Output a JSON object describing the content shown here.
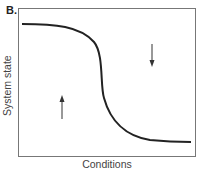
{
  "figure": {
    "panel_label": "B.",
    "y_axis_label": "System state",
    "x_axis_label": "Conditions",
    "curve": {
      "description": "Sigmoid decreasing curve: high system state at low conditions, sharp drop near the middle, low system state at high conditions",
      "color": "#222222"
    },
    "arrows": [
      {
        "name": "up-arrow",
        "direction": "up",
        "position": "below curve, left side"
      },
      {
        "name": "down-arrow",
        "direction": "down",
        "position": "above curve, right side"
      }
    ]
  }
}
